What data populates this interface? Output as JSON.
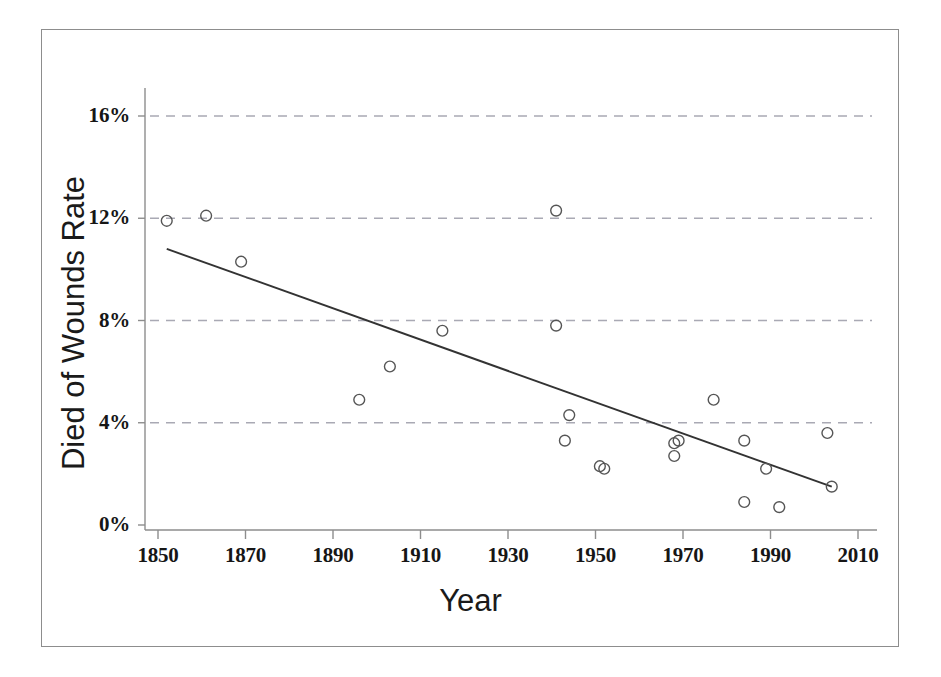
{
  "chart_data": {
    "type": "scatter",
    "title": "",
    "xlabel": "Year",
    "ylabel": "Died of Wounds Rate",
    "xlim": [
      1850,
      2010
    ],
    "ylim": [
      0,
      17.3
    ],
    "grid": "horizontal-dashed",
    "legend": "none",
    "x_ticks": [
      1850,
      1870,
      1890,
      1910,
      1930,
      1950,
      1970,
      1990,
      2010
    ],
    "x_tick_labels": [
      "1850",
      "1870",
      "1890",
      "1910",
      "1930",
      "1950",
      "1970",
      "1990",
      "2010"
    ],
    "y_ticks": [
      0,
      4,
      8,
      12,
      16
    ],
    "y_tick_labels": [
      "0%",
      "4%",
      "8%",
      "12%",
      "16%"
    ],
    "series": [
      {
        "name": "Died of Wounds Rate",
        "marker": "open-circle",
        "marker_color": "#555555",
        "points": [
          {
            "x": 1852,
            "y": 11.9
          },
          {
            "x": 1861,
            "y": 12.1
          },
          {
            "x": 1869,
            "y": 10.3
          },
          {
            "x": 1896,
            "y": 4.9
          },
          {
            "x": 1903,
            "y": 6.2
          },
          {
            "x": 1915,
            "y": 7.6
          },
          {
            "x": 1941,
            "y": 12.3
          },
          {
            "x": 1941,
            "y": 7.8
          },
          {
            "x": 1944,
            "y": 4.3
          },
          {
            "x": 1943,
            "y": 3.3
          },
          {
            "x": 1951,
            "y": 2.3
          },
          {
            "x": 1952,
            "y": 2.2
          },
          {
            "x": 1968,
            "y": 3.2
          },
          {
            "x": 1969,
            "y": 3.3
          },
          {
            "x": 1968,
            "y": 2.7
          },
          {
            "x": 1977,
            "y": 4.9
          },
          {
            "x": 1984,
            "y": 3.3
          },
          {
            "x": 1984,
            "y": 0.9
          },
          {
            "x": 1992,
            "y": 0.7
          },
          {
            "x": 1989,
            "y": 2.2
          },
          {
            "x": 2003,
            "y": 3.6
          },
          {
            "x": 2004,
            "y": 1.5
          }
        ]
      }
    ],
    "trendline": {
      "name": "linear-fit",
      "color": "#333333",
      "x_start": 1852,
      "y_start": 10.8,
      "x_end": 2004,
      "y_end": 1.5
    }
  },
  "axes": {
    "y_labels": [
      "16%",
      "12%",
      "8%",
      "4%",
      "0%"
    ],
    "x_labels": [
      "1850",
      "1870",
      "1890",
      "1910",
      "1930",
      "1950",
      "1970",
      "1990",
      "2010"
    ]
  },
  "labels": {
    "x_axis_title": "Year",
    "y_axis_title": "Died of Wounds Rate"
  }
}
